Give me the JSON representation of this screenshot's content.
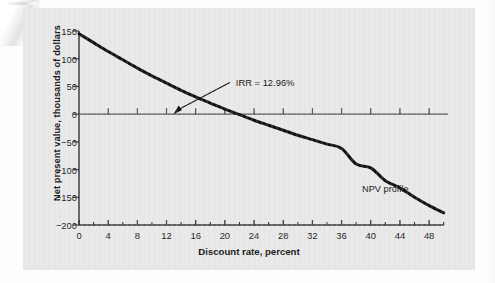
{
  "figure": {
    "background_color": "#e7e7e7",
    "page_color": "#fdfdfd",
    "curve_color": "#111111",
    "axis_color": "#333333"
  },
  "chart_data": {
    "type": "line",
    "title": "",
    "xlabel": "Discount rate, percent",
    "ylabel": "Net present value, thousands of dollars",
    "xlim": [
      0,
      51
    ],
    "ylim": [
      -200,
      150
    ],
    "grid": false,
    "legend_position": "inline-right",
    "xticks": [
      0,
      4,
      8,
      12,
      16,
      20,
      24,
      28,
      32,
      36,
      40,
      44,
      48
    ],
    "xtick_labels": [
      "0",
      "4",
      "8",
      "12",
      "16",
      "20",
      "24",
      "28",
      "32",
      "36",
      "40",
      "44",
      "48"
    ],
    "xminor_step": 2,
    "yticks": [
      150,
      100,
      50,
      0,
      -50,
      -100,
      -150,
      -200
    ],
    "ytick_labels": [
      "150",
      "100",
      "50",
      "0",
      "−50",
      "−100",
      "−150",
      "−200"
    ],
    "series": [
      {
        "name": "NPV profile",
        "label": "NPV profile",
        "x": [
          0,
          2,
          4,
          6,
          8,
          10,
          12,
          14,
          16,
          18,
          20,
          22,
          24,
          26,
          28,
          30,
          32,
          34,
          36,
          38,
          40,
          42,
          44,
          46,
          48,
          50
        ],
        "values": [
          145,
          129,
          113,
          98,
          83,
          69,
          56,
          43,
          31,
          20,
          9,
          -1,
          -11,
          -20,
          -29,
          -38,
          -46,
          -54,
          -62,
          -90,
          -97,
          -120,
          -133,
          -150,
          -165,
          -178
        ]
      }
    ],
    "annotations": [
      {
        "name": "irr-annotation",
        "text": "IRR = 12.96%",
        "x_value": 12.96,
        "y_value": 0,
        "text_x": 21.5,
        "text_y": 78
      },
      {
        "name": "npv-profile-label",
        "text": "NPV profile",
        "x_value": 42,
        "y_value": -140
      }
    ]
  },
  "axes": {
    "x_title": "Discount rate, percent",
    "y_title": "Net present value, thousands of dollars"
  }
}
